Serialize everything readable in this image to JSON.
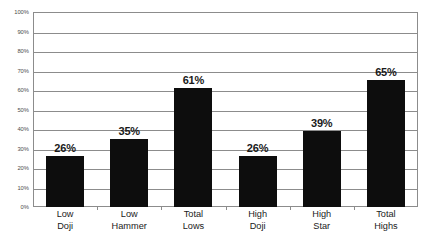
{
  "chart_data": {
    "type": "bar",
    "title": "",
    "subtitle": "",
    "xlabel": "",
    "ylabel": "",
    "categories": [
      "Low Doji",
      "Low Hammer",
      "Total Lows",
      "High Doji",
      "High Star",
      "Total Highs"
    ],
    "category_lines": [
      [
        "Low",
        "Doji"
      ],
      [
        "Low",
        "Hammer"
      ],
      [
        "Total",
        "Lows"
      ],
      [
        "High",
        "Doji"
      ],
      [
        "High",
        "Star"
      ],
      [
        "Total",
        "Highs"
      ]
    ],
    "values": [
      26,
      35,
      61,
      26,
      39,
      65
    ],
    "value_labels": [
      "26%",
      "35%",
      "61%",
      "26%",
      "39%",
      "65%"
    ],
    "ylim": [
      0,
      100
    ],
    "ytick_values": [
      0,
      10,
      20,
      30,
      40,
      50,
      60,
      70,
      80,
      90,
      100
    ],
    "ytick_labels": [
      "0%",
      "10%",
      "20%",
      "30%",
      "40%",
      "50%",
      "60%",
      "70%",
      "80%",
      "90%",
      "100%"
    ],
    "grid": true,
    "grid_axis": "y",
    "legend": false,
    "legend_position": "none",
    "bar_color": "#0d0d0d",
    "grid_color": "#8c8c8c",
    "axis_color": "#8c8c8c",
    "label_color": "#1a1a1a",
    "tick_label_color": "#4d4d4d",
    "background_color": "#ffffff"
  }
}
